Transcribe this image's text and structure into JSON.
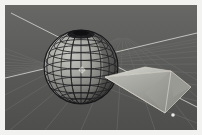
{
  "app": {
    "title": "3D Viewport",
    "view_mode": "Perspective",
    "shading": "Solid"
  },
  "frame": {
    "mat_color": "#f2f2f0",
    "border_width_px": 5
  },
  "viewport": {
    "name": "3d-viewport",
    "width_px": 192,
    "height_px": 125,
    "background_color": "#5a5a5a",
    "background_gradient_top": "#636363",
    "background_gradient_bottom": "#4f4f4f"
  },
  "grid": {
    "name": "perspective-floor-grid",
    "visible": true,
    "minor_line_color": "#6e6e6e",
    "major_line_color": "#b4b4b2",
    "axis_line_color": "#d2d2cf",
    "vanishing_point": {
      "x": 118,
      "y": 36
    },
    "horizon_y": 30,
    "major_axis_count": 2,
    "minor_line_count": 18
  },
  "objects": [
    {
      "name": "uv-sphere",
      "type": "mesh",
      "display": "solid-with-wireframe",
      "center": {
        "x": 81,
        "y": 67
      },
      "radius_px": 37,
      "segments": 16,
      "rings": 12,
      "fill_color": "#9d9d9a",
      "shade_dark_color": "#3a3a38",
      "wire_color": "#1e1e1e",
      "pole_cap_color": "#1a1a1a",
      "selected": false
    },
    {
      "name": "cone-object",
      "type": "mesh",
      "display": "solid",
      "apex": {
        "x": 104,
        "y": 74
      },
      "base_center": {
        "x": 166,
        "y": 88
      },
      "base_half_width_px": 26,
      "base_half_height_px": 22,
      "face_light_color": "#c8c8c2",
      "face_mid_color": "#a8a8a2",
      "face_dark_color": "#8e8e88",
      "edge_color": "#dedad2",
      "selected": false
    }
  ],
  "cursor_3d": {
    "name": "3d-cursor",
    "visible": true,
    "position": {
      "x": 82,
      "y": 70
    },
    "size_px": 7,
    "color": "#e8e8e4"
  },
  "origin_marker": {
    "name": "object-origin-dot",
    "visible": true,
    "position": {
      "x": 172,
      "y": 112
    },
    "color": "#f0f0ec",
    "radius_px": 2
  }
}
